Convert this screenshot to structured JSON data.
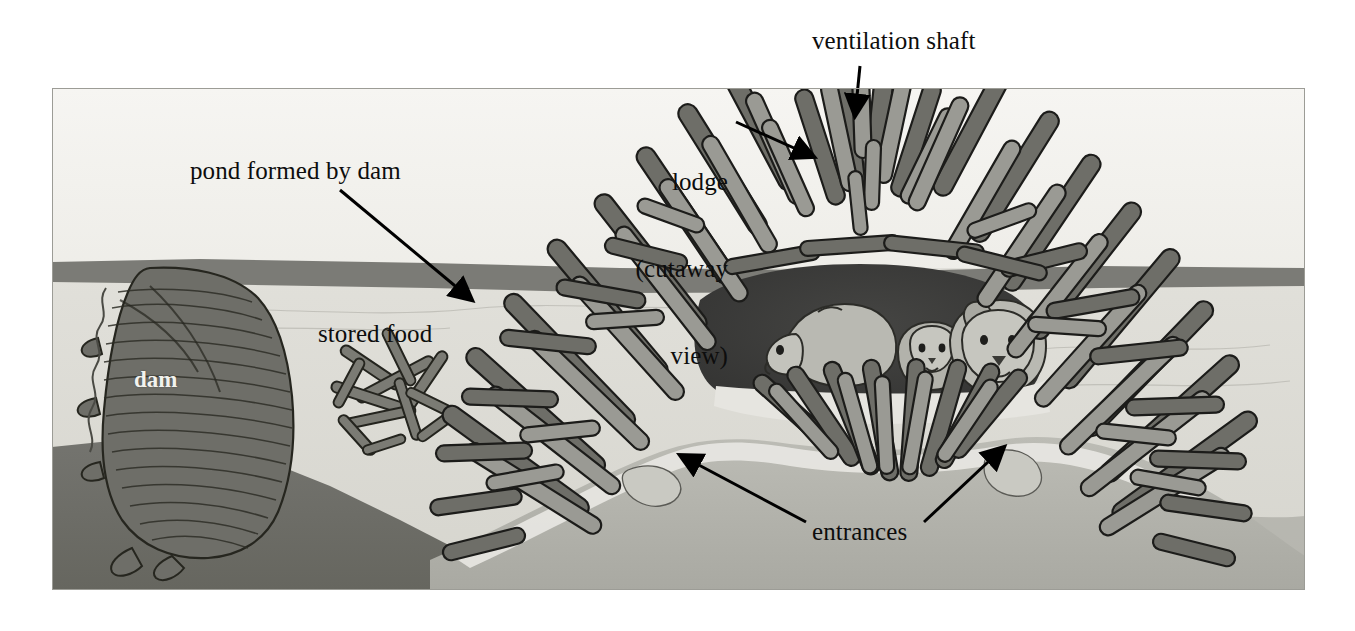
{
  "figure": {
    "kind": "labeled-illustration",
    "frame": {
      "left": 52,
      "top": 88,
      "right": 1305,
      "bottom": 590
    }
  },
  "labels": {
    "ventilation_shaft": "ventilation shaft",
    "lodge_line1": "lodge",
    "lodge_line2": "(cutaway",
    "lodge_line3": "view)",
    "pond_formed_by_dam": "pond formed by dam",
    "stored_food": "stored food",
    "entrances": "entrances",
    "dam": "dam"
  },
  "colors": {
    "page_background": "#ffffff",
    "sky": "#f2f1ed",
    "water": "#dcdcd6",
    "water_surface_band": "#7b7b76",
    "pond_floor": "#6f6f6b",
    "island_bank": "#b4b4ae",
    "island_shore": "#e6e5e0",
    "stick_light": "#9a9a94",
    "stick_dark": "#6e6e68",
    "stick_outline": "#1c1c1a",
    "lodge_chamber": "#3a3a38",
    "beaver_body": "#b9b9b2",
    "label_text": "#0d0d0d",
    "dam_label_text": "#f2f2ee",
    "arrow": "#000000"
  },
  "annotations": [
    {
      "name": "ventilation-shaft",
      "text": "ventilation shaft",
      "arrow_from": [
        858,
        68
      ],
      "arrow_to": [
        856,
        115
      ]
    },
    {
      "name": "lodge-cutaway-view",
      "text": "lodge (cutaway view)",
      "arrow_from": [
        736,
        122
      ],
      "arrow_to": [
        812,
        156
      ]
    },
    {
      "name": "pond-formed-by-dam",
      "text": "pond formed by dam",
      "arrow_from": [
        341,
        190
      ],
      "arrow_to": [
        470,
        300
      ]
    },
    {
      "name": "stored-food",
      "text": "stored food",
      "arrow_from": null,
      "arrow_to": null
    },
    {
      "name": "entrances-left",
      "text": "entrances",
      "arrow_from": [
        806,
        524
      ],
      "arrow_to": [
        680,
        455
      ]
    },
    {
      "name": "entrances-right",
      "text": "entrances",
      "arrow_from": [
        922,
        524
      ],
      "arrow_to": [
        1002,
        448
      ]
    },
    {
      "name": "dam",
      "text": "dam",
      "arrow_from": null,
      "arrow_to": null
    }
  ],
  "scene_parts": [
    {
      "name": "sky",
      "description": "pale off-white band above the waterline"
    },
    {
      "name": "water-surface-band",
      "description": "dark grey horizontal band marking the pond surface"
    },
    {
      "name": "pond-water",
      "description": "light grey water body below the surface band"
    },
    {
      "name": "dam",
      "description": "dark striated mass of packed sticks at left rising to the waterline"
    },
    {
      "name": "stored-food",
      "description": "loose scatter of cut sticks on the pond floor"
    },
    {
      "name": "lodge",
      "description": "large mound of interlocking sticks straddling the waterline"
    },
    {
      "name": "lodge-chamber",
      "description": "dark hollow interior of the lodge, shown cutaway"
    },
    {
      "name": "beavers",
      "description": "three beavers inside the chamber"
    },
    {
      "name": "entrances",
      "description": "two underwater tunnel openings in the island bank"
    },
    {
      "name": "pond-floor",
      "description": "dark grey bottom sloping down from the left bank"
    },
    {
      "name": "island-bank",
      "description": "mid-grey mound of earth the lodge is built upon"
    }
  ]
}
